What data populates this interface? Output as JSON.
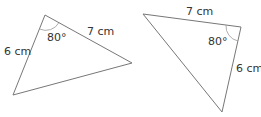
{
  "triangles": [
    {
      "side_a": "6 cm",
      "side_b": "7 cm",
      "angle": "80°",
      "vertices": [
        [
          45,
          15
        ],
        [
          13,
          95
        ],
        [
          132,
          63
        ]
      ]
    },
    {
      "side_a": "7 cm",
      "side_b": "6 cm",
      "angle": "80°",
      "vertices": [
        [
          143,
          14
        ],
        [
          241,
          27
        ],
        [
          222,
          112
        ]
      ]
    }
  ],
  "colors": {
    "stroke": "#777777",
    "text": "#333333"
  }
}
